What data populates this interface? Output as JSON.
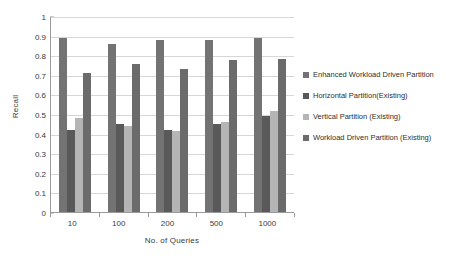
{
  "chart_data": {
    "type": "bar",
    "title": "",
    "xlabel": "No. of Queries",
    "ylabel": "Recall",
    "categories": [
      "10",
      "100",
      "200",
      "500",
      "1000"
    ],
    "ylim": [
      0,
      1
    ],
    "yticks": [
      "0",
      "0.1",
      "0.2",
      "0.3",
      "0.4",
      "0.5",
      "0.6",
      "0.7",
      "0.8",
      "0.9",
      "1"
    ],
    "grid": "horizontal",
    "legend_position": "right",
    "series": [
      {
        "name": "Enhanced Workload Driven Partition",
        "color": "#737373",
        "values": [
          0.89,
          0.855,
          0.88,
          0.88,
          0.89
        ]
      },
      {
        "name": "Horizontal Partition(Existing)",
        "color": "#595959",
        "values": [
          0.42,
          0.45,
          0.42,
          0.448,
          0.49
        ]
      },
      {
        "name": "Vertical Partition  (Existing)",
        "color": "#b5b5b5",
        "values": [
          0.48,
          0.44,
          0.415,
          0.46,
          0.515
        ]
      },
      {
        "name": "Workload Driven Partition (Existing)",
        "color": "#6b6b6b",
        "values": [
          0.71,
          0.755,
          0.73,
          0.775,
          0.78
        ]
      }
    ]
  }
}
